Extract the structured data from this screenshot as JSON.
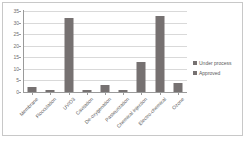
{
  "chart_data": {
    "type": "bar",
    "title": "",
    "subtitle": "",
    "xlabel": "",
    "ylabel": "",
    "ylim": [
      0,
      35
    ],
    "yticks": [
      0,
      5,
      10,
      15,
      20,
      25,
      30,
      35
    ],
    "ytick_labels": [
      "0",
      "5",
      "10",
      "15",
      "20",
      "25",
      "30",
      "35"
    ],
    "grid": true,
    "grid_axis": "y",
    "legend_position": "right",
    "categories": [
      "Membrane",
      "Flocculation",
      "UV/O3",
      "Cavitation",
      "De-oxygenation",
      "Pasteurization",
      "Chemical injection",
      "Electro-chemical",
      "Ozone"
    ],
    "series": [
      {
        "name": "Under process",
        "color": "#767171",
        "values": [
          0,
          0,
          0,
          0,
          0,
          0,
          0,
          0,
          0
        ]
      },
      {
        "name": "Approved",
        "color": "#767171",
        "values": [
          2,
          1,
          32,
          1,
          3,
          1,
          13,
          33,
          4
        ]
      }
    ],
    "plotted_values": [
      2,
      1,
      32,
      1,
      3,
      1,
      13,
      33,
      4
    ]
  },
  "legend": {
    "items": [
      {
        "label": "Under process",
        "color": "#767171"
      },
      {
        "label": "Approved",
        "color": "#767171"
      }
    ]
  },
  "colors": {
    "bar": "#767171",
    "gridline": "#d9d9d9",
    "axis": "#9a9a9a",
    "tick_text": "#6e6e6e",
    "label_text": "#595959",
    "frame_border": "#c8c8c8",
    "background": "#ffffff"
  }
}
